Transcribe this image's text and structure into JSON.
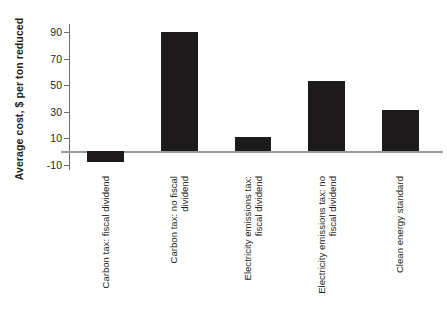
{
  "chart_data": {
    "type": "bar",
    "title": "",
    "xlabel": "",
    "ylabel": "Average cost, $ per ton reduced",
    "categories": [
      "Carbon tax: fiscal dividend",
      "Carbon tax: no fiscal\ndividend",
      "Electricity emissions tax:\nfiscal dividend",
      "Electricity emissions tax: no\nfiscal dividend",
      "Clean energy standard"
    ],
    "values": [
      -8,
      90,
      11,
      53,
      31
    ],
    "ylim": [
      -14,
      96
    ],
    "yticks": [
      90,
      70,
      50,
      30,
      10,
      -10
    ],
    "ytick_labels": [
      "90",
      "70",
      "50",
      "30",
      "10",
      "-10"
    ],
    "grid": false,
    "legend": null,
    "bar_color": "#1c1a1a",
    "axis_color": "#6f6f6f",
    "zero_line_color": "#9a9a9a"
  }
}
